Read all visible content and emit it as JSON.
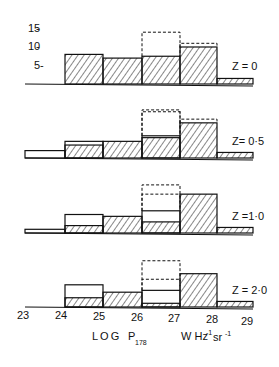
{
  "chart_data": {
    "type": "bar",
    "subtype": "stacked histogram panels",
    "title": "",
    "xlabel": "LOG P178  W Hz-1 sr-1",
    "xlabel_parts": {
      "main": "LOG",
      "symbol": "P",
      "subscript": "178",
      "units": "W Hz",
      "exp1": "-1",
      "units2": "sr",
      "exp2": "-1"
    },
    "x_ticks": [
      "23",
      "24",
      "25",
      "26",
      "27",
      "28",
      "29"
    ],
    "xlim": [
      23,
      29
    ],
    "y_ticks": [
      "15",
      "10",
      "5"
    ],
    "ylim": [
      0,
      16
    ],
    "bins": [
      "23-24",
      "24-25",
      "25-26",
      "26-27",
      "27-28",
      "28-29"
    ],
    "grid": false,
    "legend": "none; panels labelled by redshift",
    "panels": [
      {
        "label": "Z = 0",
        "series": [
          {
            "name": "hatched",
            "values": [
              0,
              8,
              7,
              7.5,
              10,
              1.5
            ]
          },
          {
            "name": "open",
            "values": [
              0,
              0,
              0,
              0,
              0,
              0
            ]
          },
          {
            "name": "dashed_upper",
            "values": [
              0,
              0,
              0,
              14,
              11,
              0
            ]
          }
        ]
      },
      {
        "label": "Z= 0·5",
        "series": [
          {
            "name": "hatched",
            "values": [
              0,
              3.5,
              4.5,
              5.5,
              9.5,
              1.5
            ]
          },
          {
            "name": "open",
            "values": [
              2,
              4.5,
              4.5,
              6,
              9.5,
              1.5
            ]
          },
          {
            "name": "dashed_upper",
            "values": [
              0,
              0,
              0,
              13,
              10.5,
              0
            ]
          },
          {
            "name": "dashed_mid",
            "values": [
              0,
              0,
              0,
              12.5,
              0,
              0
            ]
          }
        ]
      },
      {
        "label": "Z =1·0",
        "series": [
          {
            "name": "hatched",
            "values": [
              0,
              2,
              4.5,
              3,
              10.5,
              1.5
            ]
          },
          {
            "name": "open",
            "values": [
              1,
              5,
              4.5,
              6,
              10.5,
              1.5
            ]
          },
          {
            "name": "dashed_upper",
            "values": [
              0,
              0,
              0,
              13,
              0,
              0
            ]
          },
          {
            "name": "dashed_mid",
            "values": [
              0,
              0,
              0,
              10.5,
              0,
              0
            ]
          }
        ]
      },
      {
        "label": "Z = 2·0",
        "series": [
          {
            "name": "hatched",
            "values": [
              0,
              2.5,
              4,
              1,
              9,
              1.5
            ]
          },
          {
            "name": "open",
            "values": [
              0,
              6,
              4,
              4.5,
              9,
              1.5
            ]
          },
          {
            "name": "dashed_upper",
            "values": [
              0,
              0,
              0,
              12.5,
              0,
              0
            ]
          },
          {
            "name": "dashed_mid",
            "values": [
              0,
              0,
              0,
              7.5,
              0,
              0
            ]
          }
        ]
      }
    ]
  },
  "colors": {
    "ink": "#111111",
    "background": "#ffffff"
  }
}
